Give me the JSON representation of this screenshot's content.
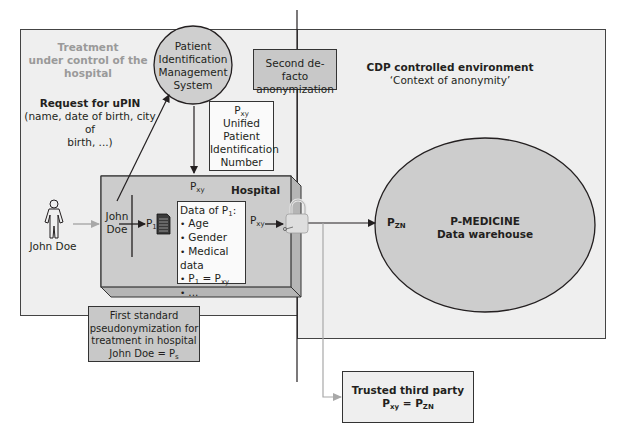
{
  "left_region": {
    "title_lines": [
      "Treatment",
      "under control of the",
      "hospital"
    ],
    "request_title": "Request for uPIN",
    "request_details": [
      "(name, date of birth, city of",
      "birth, ...)"
    ]
  },
  "pims_circle": {
    "lines": [
      "Patient",
      "Identification",
      "Management",
      "System"
    ]
  },
  "second_anonymization_box": {
    "lines": [
      "Second de-facto",
      "anonymization"
    ]
  },
  "upin_box": {
    "symbol": "P",
    "symbol_sub": "xy",
    "lines": [
      "Unified",
      "Patient",
      "Identification",
      "Number"
    ]
  },
  "person": {
    "label": "John Doe"
  },
  "hospital": {
    "title": "Hospital",
    "pxy_top": {
      "symbol": "P",
      "sub": "xy"
    },
    "john_doe_lines": [
      "John",
      "Doe"
    ],
    "p1": {
      "symbol": "P",
      "sub": "1"
    },
    "pxy_out": {
      "symbol": "P",
      "sub": "xy"
    },
    "data_box": {
      "title_prefix": "Data of P",
      "title_sub": "1",
      "title_suffix": ":",
      "items": [
        "Age",
        "Gender",
        "Medical data"
      ],
      "equality_item": {
        "left": "P",
        "left_sub": "1",
        "eq": " = ",
        "right": "P",
        "right_sub": "xy"
      },
      "ellipsis_item": "..."
    }
  },
  "first_pseudonymization_box": {
    "lines": [
      "First standard",
      "pseudonymization for",
      "treatment in hospital"
    ],
    "last_line_prefix": "John Doe = P",
    "last_line_sub": "s"
  },
  "right_region": {
    "title": "CDP controlled environment",
    "subtitle": "‘Context of anonymity’"
  },
  "warehouse": {
    "pzn": {
      "symbol": "P",
      "sub": "ZN"
    },
    "lines": [
      "P-MEDICINE",
      "Data warehouse"
    ]
  },
  "trusted_third_party": {
    "title": "Trusted third party",
    "eq_left": "P",
    "eq_left_sub": "xy",
    "eq": " = ",
    "eq_right": "P",
    "eq_right_sub": "ZN"
  },
  "colors": {
    "region_fill": "#efefef",
    "box_fill": "#c8c8c8",
    "circle_fill": "#cfcfcf",
    "hospital_fill": "#cccccc",
    "white_box": "#fafafa",
    "line": "#231f20",
    "gray_arrow": "#a8a8a8",
    "gray_title": "#9a9a9a"
  }
}
